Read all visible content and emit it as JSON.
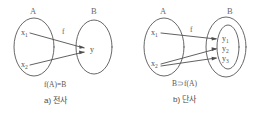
{
  "figure": {
    "background_color": "#ffffff",
    "ink_color": "#555555",
    "panels": [
      {
        "id": "surjection",
        "domain_set_label": "A",
        "codomain_set_label": "B",
        "map_label": "f",
        "domain_elements": [
          {
            "base": "x",
            "sub": "1"
          },
          {
            "base": "x",
            "sub": "2"
          }
        ],
        "codomain_elements": [
          {
            "base": "y",
            "sub": ""
          }
        ],
        "relation_text": "f(A)=B",
        "caption": "a) 전사",
        "arrows": [
          {
            "from": "x1",
            "to": "y"
          },
          {
            "from": "x2",
            "to": "y"
          }
        ]
      },
      {
        "id": "injection",
        "domain_set_label": "A",
        "codomain_set_label": "B",
        "map_label": "f",
        "domain_elements": [
          {
            "base": "x",
            "sub": "1"
          },
          {
            "base": "x",
            "sub": "2"
          }
        ],
        "codomain_elements": [
          {
            "base": "y",
            "sub": "1"
          },
          {
            "base": "y",
            "sub": "2"
          },
          {
            "base": "y",
            "sub": "3"
          }
        ],
        "relation_text": "B⊃f(A)",
        "caption": "b) 단사",
        "arrows": [
          {
            "from": "x1",
            "to": "y1"
          },
          {
            "from": "x2",
            "to": "y2"
          },
          {
            "from": "x2",
            "to": "y3"
          }
        ]
      }
    ]
  }
}
